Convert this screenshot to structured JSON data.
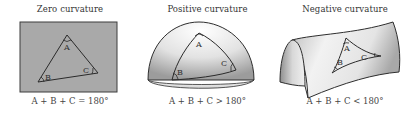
{
  "figure": {
    "panels": [
      {
        "id": "zero",
        "title": "Zero curvature",
        "caption": "A + B + C = 180°",
        "surface": "flat-plane",
        "vertices": [
          "A",
          "B",
          "C"
        ],
        "colors": {
          "surface": "#a9a9a9",
          "edge": "#3a3a3a"
        }
      },
      {
        "id": "positive",
        "title": "Positive curvature",
        "caption": "A + B + C > 180°",
        "surface": "sphere-dome",
        "vertices": [
          "A",
          "B",
          "C"
        ],
        "colors": {
          "surface": "#ececec",
          "shade": "#a8a8a8",
          "edge": "#2e2e2e"
        }
      },
      {
        "id": "negative",
        "title": "Negative curvature",
        "caption": "A + B + C < 180°",
        "surface": "saddle",
        "vertices": [
          "A",
          "B",
          "C"
        ],
        "colors": {
          "surface": "#e6e6e6",
          "shade": "#9a9a9a",
          "edge": "#2e2e2e"
        }
      }
    ]
  }
}
